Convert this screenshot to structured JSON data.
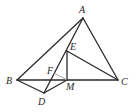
{
  "diagram": {
    "type": "geometry",
    "points": {
      "A": {
        "x": 83,
        "y": 18,
        "label": "A",
        "lx": 79,
        "ly": 13
      },
      "B": {
        "x": 17,
        "y": 80,
        "label": "B",
        "lx": 6,
        "ly": 84
      },
      "C": {
        "x": 118,
        "y": 80,
        "label": "C",
        "lx": 121,
        "ly": 85
      },
      "D": {
        "x": 44,
        "y": 93,
        "label": "D",
        "lx": 38,
        "ly": 105
      },
      "E": {
        "x": 67,
        "y": 51,
        "label": "E",
        "lx": 70,
        "ly": 50
      },
      "F": {
        "x": 54,
        "y": 73,
        "label": "F",
        "lx": 47,
        "ly": 74
      },
      "M": {
        "x": 67,
        "y": 80,
        "label": "M",
        "lx": 66,
        "ly": 90
      }
    },
    "segments": [
      [
        "A",
        "B"
      ],
      [
        "A",
        "C"
      ],
      [
        "B",
        "C"
      ],
      [
        "A",
        "D"
      ],
      [
        "B",
        "D"
      ],
      [
        "D",
        "M"
      ],
      [
        "E",
        "M"
      ],
      [
        "E",
        "C"
      ]
    ],
    "thin_segments": [
      [
        "F",
        "M"
      ]
    ],
    "stroke_color": "#2a2a2a",
    "thin_color": "#9a9a9a"
  }
}
